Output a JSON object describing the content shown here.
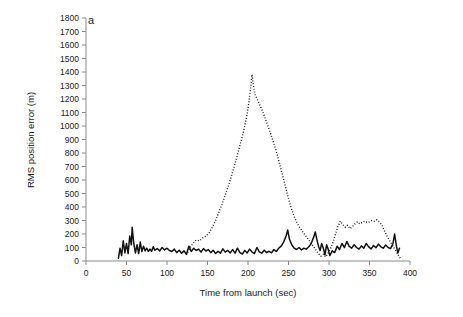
{
  "figure": {
    "panel_label": "a",
    "background_color": "#ffffff",
    "axis_color": "#8a8a8a",
    "series_color": "#111111"
  },
  "chart_data": {
    "type": "line",
    "title": "",
    "subtitle": "",
    "xlabel": "Time from launch (sec)",
    "ylabel": "RMS position error (m)",
    "xlim": [
      0,
      400
    ],
    "ylim": [
      0,
      1800
    ],
    "xticks": [
      0,
      50,
      100,
      150,
      200,
      250,
      300,
      350,
      400
    ],
    "xtick_labels": [
      "0",
      "50",
      "100",
      "150",
      "200",
      "250",
      "300",
      "350",
      "400"
    ],
    "yticks": [
      0,
      100,
      200,
      300,
      400,
      500,
      600,
      700,
      800,
      900,
      1000,
      1100,
      1200,
      1300,
      1400,
      1500,
      1600,
      1700,
      1800
    ],
    "ytick_labels": [
      "0",
      "100",
      "200",
      "300",
      "400",
      "500",
      "600",
      "700",
      "800",
      "900",
      "1000",
      "1100",
      "1200",
      "1300",
      "1400",
      "1500",
      "1600",
      "1700",
      "1800"
    ],
    "grid": false,
    "legend": false,
    "legend_position": "none",
    "annotations": [
      "a"
    ],
    "series": [
      {
        "name": "solid-series",
        "style": "solid",
        "color": "#111111",
        "points": [
          [
            40,
            20
          ],
          [
            42,
            95
          ],
          [
            44,
            40
          ],
          [
            46,
            150
          ],
          [
            48,
            60
          ],
          [
            50,
            130
          ],
          [
            52,
            55
          ],
          [
            54,
            185
          ],
          [
            56,
            120
          ],
          [
            57,
            250
          ],
          [
            59,
            130
          ],
          [
            61,
            60
          ],
          [
            63,
            120
          ],
          [
            65,
            55
          ],
          [
            67,
            140
          ],
          [
            69,
            70
          ],
          [
            71,
            110
          ],
          [
            73,
            75
          ],
          [
            75,
            95
          ],
          [
            77,
            70
          ],
          [
            79,
            88
          ],
          [
            81,
            72
          ],
          [
            83,
            105
          ],
          [
            85,
            80
          ],
          [
            88,
            92
          ],
          [
            91,
            75
          ],
          [
            94,
            100
          ],
          [
            97,
            82
          ],
          [
            100,
            95
          ],
          [
            103,
            78
          ],
          [
            106,
            70
          ],
          [
            109,
            88
          ],
          [
            112,
            62
          ],
          [
            115,
            80
          ],
          [
            118,
            58
          ],
          [
            121,
            75
          ],
          [
            124,
            50
          ],
          [
            127,
            110
          ],
          [
            130,
            70
          ],
          [
            133,
            95
          ],
          [
            136,
            78
          ],
          [
            139,
            88
          ],
          [
            142,
            66
          ],
          [
            145,
            92
          ],
          [
            148,
            74
          ],
          [
            151,
            85
          ],
          [
            154,
            62
          ],
          [
            157,
            80
          ],
          [
            160,
            55
          ],
          [
            163,
            72
          ],
          [
            166,
            58
          ],
          [
            169,
            90
          ],
          [
            172,
            66
          ],
          [
            175,
            78
          ],
          [
            178,
            60
          ],
          [
            181,
            84
          ],
          [
            184,
            58
          ],
          [
            187,
            95
          ],
          [
            190,
            62
          ],
          [
            193,
            52
          ],
          [
            196,
            78
          ],
          [
            199,
            60
          ],
          [
            202,
            88
          ],
          [
            205,
            66
          ],
          [
            208,
            55
          ],
          [
            211,
            100
          ],
          [
            214,
            68
          ],
          [
            217,
            58
          ],
          [
            220,
            80
          ],
          [
            223,
            62
          ],
          [
            226,
            72
          ],
          [
            229,
            60
          ],
          [
            232,
            85
          ],
          [
            235,
            70
          ],
          [
            238,
            95
          ],
          [
            241,
            110
          ],
          [
            244,
            140
          ],
          [
            247,
            185
          ],
          [
            249,
            230
          ],
          [
            251,
            165
          ],
          [
            254,
            120
          ],
          [
            257,
            95
          ],
          [
            260,
            85
          ],
          [
            263,
            100
          ],
          [
            266,
            82
          ],
          [
            269,
            95
          ],
          [
            272,
            88
          ],
          [
            275,
            105
          ],
          [
            278,
            130
          ],
          [
            281,
            175
          ],
          [
            283,
            215
          ],
          [
            285,
            160
          ],
          [
            287,
            110
          ],
          [
            289,
            78
          ],
          [
            291,
            130
          ],
          [
            293,
            95
          ],
          [
            295,
            45
          ],
          [
            297,
            120
          ],
          [
            299,
            88
          ],
          [
            301,
            40
          ],
          [
            304,
            75
          ],
          [
            307,
            62
          ],
          [
            310,
            110
          ],
          [
            313,
            85
          ],
          [
            316,
            130
          ],
          [
            319,
            100
          ],
          [
            322,
            145
          ],
          [
            325,
            108
          ],
          [
            328,
            95
          ],
          [
            331,
            120
          ],
          [
            334,
            100
          ],
          [
            337,
            88
          ],
          [
            340,
            112
          ],
          [
            343,
            95
          ],
          [
            346,
            130
          ],
          [
            349,
            105
          ],
          [
            352,
            90
          ],
          [
            355,
            115
          ],
          [
            358,
            98
          ],
          [
            361,
            125
          ],
          [
            364,
            105
          ],
          [
            367,
            95
          ],
          [
            370,
            118
          ],
          [
            373,
            100
          ],
          [
            376,
            92
          ],
          [
            379,
            130
          ],
          [
            381,
            200
          ],
          [
            383,
            120
          ],
          [
            385,
            60
          ],
          [
            387,
            95
          ]
        ]
      },
      {
        "name": "dotted-series",
        "style": "dotted",
        "color": "#111111",
        "points": [
          [
            124,
            45
          ],
          [
            128,
            95
          ],
          [
            132,
            130
          ],
          [
            136,
            155
          ],
          [
            140,
            150
          ],
          [
            144,
            170
          ],
          [
            148,
            185
          ],
          [
            152,
            210
          ],
          [
            156,
            250
          ],
          [
            160,
            300
          ],
          [
            164,
            360
          ],
          [
            168,
            420
          ],
          [
            172,
            490
          ],
          [
            176,
            560
          ],
          [
            180,
            640
          ],
          [
            184,
            720
          ],
          [
            188,
            810
          ],
          [
            192,
            900
          ],
          [
            196,
            1000
          ],
          [
            199,
            1090
          ],
          [
            201,
            1170
          ],
          [
            203,
            1270
          ],
          [
            205,
            1380
          ],
          [
            207,
            1290
          ],
          [
            209,
            1230
          ],
          [
            212,
            1190
          ],
          [
            215,
            1150
          ],
          [
            218,
            1110
          ],
          [
            221,
            1060
          ],
          [
            224,
            1010
          ],
          [
            227,
            960
          ],
          [
            230,
            905
          ],
          [
            233,
            850
          ],
          [
            236,
            790
          ],
          [
            239,
            720
          ],
          [
            242,
            650
          ],
          [
            245,
            580
          ],
          [
            248,
            510
          ],
          [
            251,
            440
          ],
          [
            254,
            380
          ],
          [
            257,
            330
          ],
          [
            260,
            290
          ],
          [
            263,
            255
          ],
          [
            266,
            230
          ],
          [
            269,
            205
          ],
          [
            272,
            180
          ],
          [
            275,
            155
          ],
          [
            278,
            130
          ],
          [
            281,
            105
          ],
          [
            284,
            80
          ],
          [
            287,
            55
          ],
          [
            290,
            35
          ],
          [
            293,
            50
          ],
          [
            296,
            30
          ],
          [
            299,
            60
          ],
          [
            302,
            95
          ],
          [
            305,
            140
          ],
          [
            308,
            200
          ],
          [
            311,
            255
          ],
          [
            314,
            295
          ],
          [
            317,
            270
          ],
          [
            320,
            250
          ],
          [
            323,
            265
          ],
          [
            326,
            240
          ],
          [
            329,
            255
          ],
          [
            332,
            275
          ],
          [
            335,
            290
          ],
          [
            338,
            275
          ],
          [
            341,
            285
          ],
          [
            344,
            295
          ],
          [
            347,
            285
          ],
          [
            350,
            290
          ],
          [
            353,
            300
          ],
          [
            356,
            295
          ],
          [
            359,
            305
          ],
          [
            362,
            290
          ],
          [
            365,
            270
          ],
          [
            368,
            230
          ],
          [
            371,
            190
          ],
          [
            374,
            160
          ],
          [
            377,
            130
          ],
          [
            380,
            100
          ],
          [
            383,
            70
          ],
          [
            386,
            40
          ],
          [
            388,
            20
          ]
        ]
      }
    ]
  }
}
